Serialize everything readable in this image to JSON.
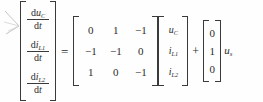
{
  "equation": {
    "kind": "state-space-matrix-equation",
    "derivative_vector": {
      "label": "state-derivative-column-vector",
      "entries": [
        {
          "numerator_d": "d",
          "numerator_var": "u",
          "numerator_sub": "C",
          "denominator_d": "d",
          "denominator_var": "t"
        },
        {
          "numerator_d": "d",
          "numerator_var": "i",
          "numerator_sub": "L1",
          "denominator_d": "d",
          "denominator_var": "t"
        },
        {
          "numerator_d": "d",
          "numerator_var": "i",
          "numerator_sub": "L2",
          "denominator_d": "d",
          "denominator_var": "t"
        }
      ]
    },
    "equals_sign": "=",
    "plus_sign": "+",
    "system_matrix": {
      "label": "coefficient-matrix-A",
      "rows": [
        [
          "0",
          "1",
          "−1"
        ],
        [
          "−1",
          "−1",
          "0"
        ],
        [
          "1",
          "0",
          "−1"
        ]
      ]
    },
    "state_vector": {
      "label": "state-column-vector",
      "entries": [
        {
          "var": "u",
          "sub": "C"
        },
        {
          "var": "i",
          "sub": "L1"
        },
        {
          "var": "i",
          "sub": "L2"
        }
      ]
    },
    "input_vector": {
      "label": "input-column-vector-b",
      "entries": [
        "0",
        "1",
        "0"
      ]
    },
    "input_variable": {
      "var": "u",
      "sub": "s"
    }
  },
  "annotation": {
    "margin_mark": "hand-drawn-arrow-artifact"
  },
  "colors": {
    "background": "#fefefe",
    "ink": "#2b2b2b",
    "rule": "#3a3a3a"
  }
}
